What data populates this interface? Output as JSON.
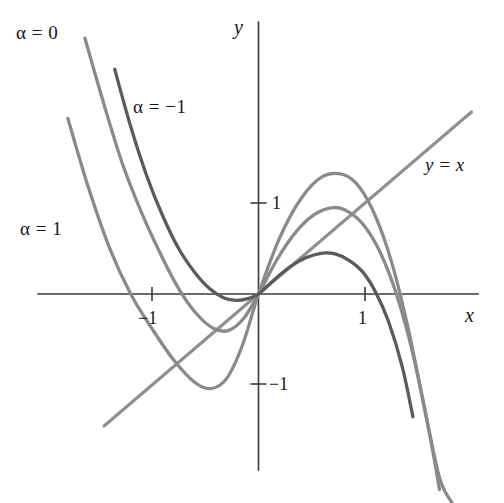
{
  "figure": {
    "background_color": "#ffffff",
    "axis_color": "#3b3b3f",
    "curve_color_light": "#8a8a8a",
    "curve_color_dark": "#5b5b5b",
    "line_color": "#8f8f8f"
  },
  "axes": {
    "x_name": "x",
    "y_name": "y",
    "origin_px": {
      "x": 258.5,
      "y": 294
    },
    "x_scale_px_per_unit": 106.5,
    "y_scale_px_per_unit": 91,
    "x_axis_extent_px": {
      "from": 38,
      "to": 478
    },
    "y_axis_extent_px": {
      "from": 22,
      "to": 470
    },
    "ticks": {
      "x": [
        {
          "value": -1,
          "label": "−1",
          "px": 152
        },
        {
          "value": 1,
          "label": "1",
          "px": 365
        }
      ],
      "y": [
        {
          "value": 1,
          "label": "1",
          "px": 203
        },
        {
          "value": -1,
          "label": "−1",
          "px": 384
        }
      ]
    }
  },
  "labels": {
    "alpha_0": "α = 0",
    "alpha_minus_1": "α = −1",
    "alpha_1": "α = 1",
    "identity_line": "y = x"
  },
  "chart_data": {
    "type": "line",
    "title": "",
    "subtitle": "",
    "xlabel": "x",
    "ylabel": "y",
    "xlim": [
      -2.07,
      2.06
    ],
    "ylim": [
      -2.3,
      2.99
    ],
    "grid": false,
    "legend": "inline-curve-labels",
    "annotations": [
      {
        "text": "α = 0",
        "x": -1.95,
        "y": 2.72
      },
      {
        "text": "α = −1",
        "x": -0.85,
        "y": 1.92
      },
      {
        "text": "α = 1",
        "x": -1.9,
        "y": 0.58
      },
      {
        "text": "y = x",
        "x": 1.65,
        "y": 1.35
      }
    ],
    "series": [
      {
        "name": "y = x",
        "kind": "reference-line",
        "color": "#8f8f8f",
        "x": [
          -1.45,
          2.0
        ],
        "values": [
          -1.45,
          2.0
        ]
      },
      {
        "name": "α = 1",
        "kind": "curve",
        "color": "#8a8a8a",
        "x": [
          -1.79,
          -1.6,
          -1.4,
          -1.2,
          -1.0,
          -0.8,
          -0.6,
          -0.45,
          -0.3,
          -0.15,
          0.0,
          0.2,
          0.4,
          0.6,
          0.8,
          0.95,
          1.1,
          1.25,
          1.4,
          1.55,
          1.7,
          1.82
        ],
        "values": [
          1.93,
          1.18,
          0.51,
          0.0,
          -0.38,
          -0.72,
          -0.97,
          -1.04,
          -0.93,
          -0.56,
          0.0,
          0.62,
          1.05,
          1.29,
          1.31,
          1.17,
          0.85,
          0.35,
          -0.35,
          -1.2,
          -2.02,
          -2.3
        ]
      },
      {
        "name": "α = 0",
        "kind": "curve",
        "color": "#8a8a8a",
        "x": [
          -1.63,
          -1.45,
          -1.28,
          -1.1,
          -0.92,
          -0.75,
          -0.58,
          -0.42,
          -0.28,
          -0.14,
          0.0,
          0.18,
          0.35,
          0.52,
          0.7,
          0.85,
          1.0,
          1.15,
          1.3,
          1.45,
          1.6,
          1.7
        ],
        "values": [
          2.81,
          2.08,
          1.44,
          0.9,
          0.44,
          0.06,
          -0.22,
          -0.38,
          -0.4,
          -0.27,
          0.0,
          0.39,
          0.68,
          0.87,
          0.95,
          0.9,
          0.74,
          0.44,
          -0.02,
          -0.66,
          -1.5,
          -2.15
        ]
      },
      {
        "name": "α = −1",
        "kind": "curve",
        "color": "#5b5b5b",
        "x": [
          -1.35,
          -1.2,
          -1.05,
          -0.9,
          -0.75,
          -0.6,
          -0.46,
          -0.33,
          -0.21,
          -0.1,
          0.0,
          0.15,
          0.3,
          0.45,
          0.6,
          0.72,
          0.85,
          0.98,
          1.1,
          1.22,
          1.35,
          1.45
        ],
        "values": [
          2.47,
          1.84,
          1.3,
          0.86,
          0.5,
          0.24,
          0.06,
          -0.04,
          -0.07,
          -0.05,
          0.0,
          0.16,
          0.3,
          0.4,
          0.45,
          0.44,
          0.37,
          0.24,
          0.02,
          -0.3,
          -0.8,
          -1.35
        ]
      }
    ]
  }
}
